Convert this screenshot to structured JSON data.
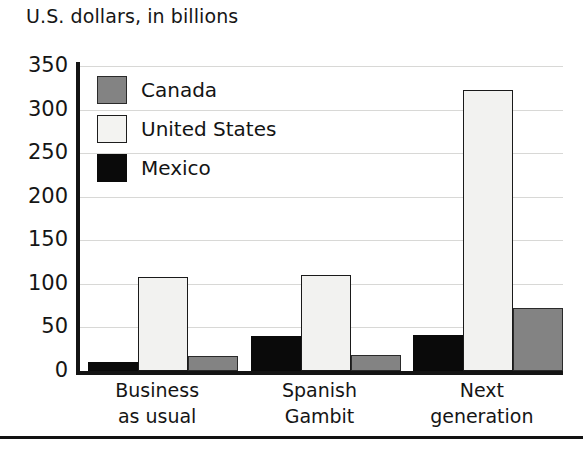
{
  "chart_data": {
    "type": "bar",
    "title": "U.S. dollars, in billions",
    "xlabel": "",
    "ylabel": "",
    "ylim": [
      0,
      350
    ],
    "yticks": [
      0,
      50,
      100,
      150,
      200,
      250,
      300,
      350
    ],
    "grid": true,
    "legend_position": "top-left",
    "categories": [
      "Business as usual",
      "Spanish Gambit",
      "Next generation"
    ],
    "category_lines": [
      [
        "Business",
        "as usual"
      ],
      [
        "Spanish",
        "Gambit"
      ],
      [
        "Next",
        "generation"
      ]
    ],
    "series": [
      {
        "name": "Mexico",
        "color": "#0a0a0a",
        "values": [
          10,
          40,
          41
        ]
      },
      {
        "name": "United States",
        "color": "#f2f2f0",
        "values": [
          108,
          110,
          322
        ]
      },
      {
        "name": "Canada",
        "color": "#838383",
        "values": [
          17,
          18,
          72
        ]
      }
    ],
    "legend_order": [
      "Canada",
      "United States",
      "Mexico"
    ],
    "bar_draw_order": [
      "Mexico",
      "United States",
      "Canada"
    ]
  },
  "legend": {
    "items": [
      {
        "label": "Canada",
        "swatch": "canada"
      },
      {
        "label": "United States",
        "swatch": "united-states"
      },
      {
        "label": "Mexico",
        "swatch": "mexico"
      }
    ]
  }
}
